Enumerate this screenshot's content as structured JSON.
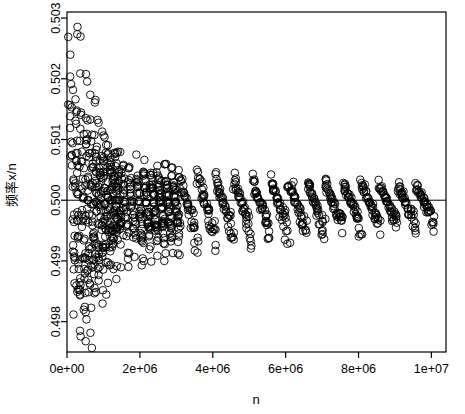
{
  "chart_data": {
    "type": "scatter",
    "title": "",
    "xlabel": "n",
    "ylabel": "频率x/n",
    "xlim": [
      0,
      10400000
    ],
    "ylim": [
      0.4975,
      0.5031
    ],
    "grid": false,
    "legend": null,
    "xticks": [
      "0e+00",
      "2e+06",
      "4e+06",
      "6e+06",
      "8e+06",
      "1e+07"
    ],
    "xtick_values": [
      0,
      2000000,
      4000000,
      6000000,
      8000000,
      10000000
    ],
    "yticks": [
      "0.498",
      "0.499",
      "0.500",
      "0.501",
      "0.502",
      "0.503"
    ],
    "ytick_values": [
      0.498,
      0.499,
      0.5,
      0.501,
      0.502,
      0.503
    ],
    "reference_line": {
      "y": 0.5,
      "orientation": "horizontal",
      "color": "#000000"
    },
    "marker": {
      "shape": "circle-open",
      "color": "#000000",
      "size": 5
    },
    "points_note": "约1000个随机模拟点，频率随n增大收敛于0.5",
    "points": [
      [
        60000,
        0.50275
      ],
      [
        95000,
        0.50175
      ],
      [
        120000,
        0.50165
      ],
      [
        140000,
        0.5013
      ],
      [
        150000,
        0.50085
      ],
      [
        160000,
        0.5006
      ],
      [
        170000,
        0.50025
      ],
      [
        180000,
        0.49965
      ],
      [
        190000,
        0.49935
      ],
      [
        200000,
        0.49885
      ],
      [
        210000,
        0.49835
      ],
      [
        220000,
        0.4979
      ],
      [
        230000,
        0.49765
      ],
      [
        240000,
        0.50215
      ],
      [
        250000,
        0.50155
      ],
      [
        260000,
        0.50115
      ],
      [
        270000,
        0.50075
      ],
      [
        280000,
        0.5004
      ],
      [
        290000,
        0.5001
      ],
      [
        300000,
        0.49975
      ],
      [
        310000,
        0.49945
      ],
      [
        320000,
        0.49915
      ],
      [
        330000,
        0.4988
      ],
      [
        340000,
        0.49845
      ],
      [
        350000,
        0.49805
      ],
      [
        360000,
        0.49755
      ],
      [
        370000,
        0.49725
      ],
      [
        380000,
        0.50195
      ],
      [
        390000,
        0.50145
      ],
      [
        400000,
        0.50105
      ],
      [
        410000,
        0.50065
      ],
      [
        420000,
        0.5003
      ],
      [
        430000,
        0.50005
      ],
      [
        440000,
        0.4998
      ],
      [
        450000,
        0.49955
      ],
      [
        460000,
        0.49925
      ],
      [
        470000,
        0.49895
      ],
      [
        480000,
        0.49865
      ],
      [
        490000,
        0.4983
      ],
      [
        500000,
        0.49795
      ],
      [
        510000,
        0.4976
      ],
      [
        520000,
        0.50165
      ],
      [
        530000,
        0.50125
      ],
      [
        540000,
        0.50085
      ],
      [
        550000,
        0.50055
      ],
      [
        560000,
        0.50025
      ],
      [
        570000,
        0.5
      ],
      [
        580000,
        0.49975
      ],
      [
        590000,
        0.49945
      ],
      [
        600000,
        0.49915
      ],
      [
        610000,
        0.4989
      ],
      [
        620000,
        0.4986
      ],
      [
        630000,
        0.49825
      ],
      [
        640000,
        0.49785
      ],
      [
        650000,
        0.50135
      ],
      [
        660000,
        0.50105
      ],
      [
        670000,
        0.50075
      ],
      [
        680000,
        0.50045
      ],
      [
        690000,
        0.5002
      ],
      [
        700000,
        0.49995
      ],
      [
        710000,
        0.4997
      ],
      [
        720000,
        0.49945
      ],
      [
        730000,
        0.4992
      ],
      [
        740000,
        0.49895
      ],
      [
        750000,
        0.49865
      ],
      [
        760000,
        0.4983
      ],
      [
        770000,
        0.50115
      ],
      [
        780000,
        0.50085
      ],
      [
        790000,
        0.5006
      ],
      [
        800000,
        0.50035
      ],
      [
        810000,
        0.50015
      ],
      [
        820000,
        0.49995
      ],
      [
        830000,
        0.4997
      ],
      [
        840000,
        0.49945
      ],
      [
        850000,
        0.4992
      ],
      [
        860000,
        0.49895
      ],
      [
        870000,
        0.49865
      ],
      [
        880000,
        0.50105
      ],
      [
        890000,
        0.50075
      ],
      [
        900000,
        0.5005
      ],
      [
        910000,
        0.5003
      ],
      [
        920000,
        0.5001
      ],
      [
        930000,
        0.4999
      ],
      [
        940000,
        0.4997
      ],
      [
        950000,
        0.49945
      ],
      [
        960000,
        0.4992
      ],
      [
        970000,
        0.49895
      ],
      [
        980000,
        0.4987
      ],
      [
        990000,
        0.50095
      ],
      [
        1000000,
        0.50075
      ],
      [
        1010000,
        0.50055
      ],
      [
        1020000,
        0.50035
      ],
      [
        1030000,
        0.50015
      ],
      [
        1040000,
        0.49995
      ],
      [
        1050000,
        0.49975
      ],
      [
        1060000,
        0.49955
      ],
      [
        1070000,
        0.49935
      ],
      [
        1080000,
        0.4991
      ],
      [
        1090000,
        0.49885
      ],
      [
        1100000,
        0.50085
      ],
      [
        1110000,
        0.50065
      ],
      [
        1120000,
        0.50045
      ],
      [
        1130000,
        0.50025
      ],
      [
        1140000,
        0.50005
      ],
      [
        1150000,
        0.49985
      ],
      [
        1160000,
        0.49965
      ],
      [
        1170000,
        0.49945
      ],
      [
        1180000,
        0.49925
      ],
      [
        1190000,
        0.49905
      ],
      [
        1200000,
        0.50075
      ],
      [
        1210000,
        0.50055
      ],
      [
        1220000,
        0.50035
      ],
      [
        1230000,
        0.50018
      ],
      [
        1240000,
        0.5
      ],
      [
        1250000,
        0.49982
      ],
      [
        1260000,
        0.49965
      ],
      [
        1270000,
        0.49945
      ],
      [
        1280000,
        0.49925
      ],
      [
        1290000,
        0.49905
      ],
      [
        1300000,
        0.50068
      ],
      [
        1310000,
        0.5005
      ],
      [
        1320000,
        0.50033
      ],
      [
        1330000,
        0.50016
      ],
      [
        1340000,
        0.5
      ],
      [
        1350000,
        0.49984
      ],
      [
        1360000,
        0.49967
      ],
      [
        1370000,
        0.4995
      ],
      [
        1380000,
        0.4993
      ],
      [
        1390000,
        0.4991
      ],
      [
        1400000,
        0.50062
      ],
      [
        1410000,
        0.50046
      ],
      [
        1420000,
        0.5003
      ],
      [
        1430000,
        0.50015
      ],
      [
        1440000,
        0.5
      ],
      [
        1450000,
        0.49985
      ],
      [
        1460000,
        0.4997
      ],
      [
        1470000,
        0.49952
      ],
      [
        1480000,
        0.49934
      ],
      [
        1490000,
        0.49915
      ],
      [
        1500000,
        0.50058
      ],
      [
        1520000,
        0.50042
      ],
      [
        1540000,
        0.50027
      ],
      [
        1560000,
        0.50012
      ],
      [
        1580000,
        0.49998
      ],
      [
        1600000,
        0.49984
      ],
      [
        1620000,
        0.49969
      ],
      [
        1640000,
        0.49953
      ],
      [
        1660000,
        0.49936
      ],
      [
        1680000,
        0.49918
      ],
      [
        1700000,
        0.50055
      ],
      [
        1720000,
        0.5004
      ],
      [
        1740000,
        0.50025
      ],
      [
        1760000,
        0.50011
      ],
      [
        1780000,
        0.49997
      ],
      [
        1800000,
        0.49984
      ],
      [
        1820000,
        0.4997
      ],
      [
        1840000,
        0.49955
      ],
      [
        1860000,
        0.49938
      ],
      [
        1880000,
        0.4992
      ],
      [
        1900000,
        0.50052
      ],
      [
        1920000,
        0.50037
      ],
      [
        1940000,
        0.50023
      ],
      [
        1960000,
        0.5001
      ],
      [
        1980000,
        0.49997
      ],
      [
        2000000,
        0.49984
      ],
      [
        2020000,
        0.4997
      ],
      [
        2040000,
        0.49956
      ],
      [
        2060000,
        0.4994
      ],
      [
        2080000,
        0.49922
      ],
      [
        2100000,
        0.50048
      ],
      [
        2120000,
        0.50035
      ],
      [
        2140000,
        0.50022
      ],
      [
        2160000,
        0.50009
      ],
      [
        2180000,
        0.49996
      ],
      [
        2200000,
        0.49984
      ],
      [
        2220000,
        0.49971
      ],
      [
        2240000,
        0.49957
      ],
      [
        2260000,
        0.49942
      ],
      [
        2280000,
        0.49926
      ],
      [
        2300000,
        0.50046
      ],
      [
        2320000,
        0.50033
      ],
      [
        2340000,
        0.50021
      ],
      [
        2360000,
        0.50008
      ],
      [
        2380000,
        0.49996
      ],
      [
        2400000,
        0.49984
      ],
      [
        2420000,
        0.49972
      ],
      [
        2440000,
        0.49958
      ],
      [
        2460000,
        0.49944
      ],
      [
        2480000,
        0.49928
      ],
      [
        2500000,
        0.50044
      ],
      [
        2520000,
        0.50032
      ],
      [
        2540000,
        0.5002
      ],
      [
        2560000,
        0.50008
      ],
      [
        2580000,
        0.49996
      ],
      [
        2600000,
        0.49984
      ],
      [
        2620000,
        0.49972
      ],
      [
        2640000,
        0.4996
      ],
      [
        2660000,
        0.49946
      ],
      [
        2680000,
        0.49931
      ],
      [
        2700000,
        0.50042
      ],
      [
        2720000,
        0.5003
      ],
      [
        2740000,
        0.50019
      ],
      [
        2760000,
        0.50007
      ],
      [
        2780000,
        0.49996
      ],
      [
        2800000,
        0.49985
      ],
      [
        2820000,
        0.49973
      ],
      [
        2840000,
        0.49961
      ],
      [
        2860000,
        0.49948
      ],
      [
        2880000,
        0.49934
      ],
      [
        2900000,
        0.5004
      ],
      [
        2920000,
        0.50029
      ],
      [
        2940000,
        0.50018
      ],
      [
        2960000,
        0.50007
      ],
      [
        2980000,
        0.49996
      ],
      [
        3000000,
        0.49985
      ],
      [
        3020000,
        0.49974
      ],
      [
        3040000,
        0.49962
      ],
      [
        3060000,
        0.4995
      ],
      [
        3080000,
        0.49936
      ],
      [
        3100000,
        0.50038
      ],
      [
        3150000,
        0.50027
      ],
      [
        3200000,
        0.50016
      ],
      [
        3250000,
        0.50006
      ],
      [
        3300000,
        0.49995
      ],
      [
        3350000,
        0.49985
      ],
      [
        3400000,
        0.49974
      ],
      [
        3450000,
        0.49963
      ],
      [
        3500000,
        0.4995
      ],
      [
        3550000,
        0.49938
      ],
      [
        3600000,
        0.50036
      ],
      [
        3650000,
        0.50026
      ],
      [
        3700000,
        0.50015
      ],
      [
        3750000,
        0.50005
      ],
      [
        3800000,
        0.49995
      ],
      [
        3850000,
        0.49985
      ],
      [
        3900000,
        0.49975
      ],
      [
        3950000,
        0.49964
      ],
      [
        4000000,
        0.49952
      ],
      [
        4050000,
        0.4994
      ],
      [
        4100000,
        0.50034
      ],
      [
        4150000,
        0.50024
      ],
      [
        4200000,
        0.50014
      ],
      [
        4250000,
        0.50005
      ],
      [
        4300000,
        0.49995
      ],
      [
        4350000,
        0.49986
      ],
      [
        4400000,
        0.49976
      ],
      [
        4450000,
        0.49966
      ],
      [
        4500000,
        0.49954
      ],
      [
        4550000,
        0.49942
      ],
      [
        4600000,
        0.50032
      ],
      [
        4650000,
        0.50023
      ],
      [
        4700000,
        0.50014
      ],
      [
        4750000,
        0.50005
      ],
      [
        4800000,
        0.49996
      ],
      [
        4850000,
        0.49986
      ],
      [
        4900000,
        0.49977
      ],
      [
        4950000,
        0.49967
      ],
      [
        5000000,
        0.49956
      ],
      [
        5050000,
        0.49944
      ],
      [
        5100000,
        0.50031
      ],
      [
        5150000,
        0.50022
      ],
      [
        5200000,
        0.50013
      ],
      [
        5250000,
        0.50004
      ],
      [
        5300000,
        0.49996
      ],
      [
        5350000,
        0.49987
      ],
      [
        5400000,
        0.49978
      ],
      [
        5450000,
        0.49968
      ],
      [
        5500000,
        0.49958
      ],
      [
        5550000,
        0.49946
      ],
      [
        5600000,
        0.5003
      ],
      [
        5650000,
        0.50021
      ],
      [
        5700000,
        0.50013
      ],
      [
        5750000,
        0.50004
      ],
      [
        5800000,
        0.49996
      ],
      [
        5850000,
        0.49988
      ],
      [
        5900000,
        0.49979
      ],
      [
        5950000,
        0.4997
      ],
      [
        6000000,
        0.4996
      ],
      [
        6050000,
        0.49948
      ],
      [
        6100000,
        0.50029
      ],
      [
        6150000,
        0.50021
      ],
      [
        6200000,
        0.50012
      ],
      [
        6250000,
        0.50004
      ],
      [
        6300000,
        0.49996
      ],
      [
        6350000,
        0.49988
      ],
      [
        6400000,
        0.4998
      ],
      [
        6450000,
        0.49971
      ],
      [
        6500000,
        0.49961
      ],
      [
        6550000,
        0.4995
      ],
      [
        6600000,
        0.50028
      ],
      [
        6650000,
        0.5002
      ],
      [
        6700000,
        0.50012
      ],
      [
        6750000,
        0.50004
      ],
      [
        6800000,
        0.49996
      ],
      [
        6850000,
        0.49988
      ],
      [
        6900000,
        0.4998
      ],
      [
        6950000,
        0.49972
      ],
      [
        7000000,
        0.49963
      ],
      [
        7050000,
        0.49952
      ],
      [
        7100000,
        0.50027
      ],
      [
        7150000,
        0.50019
      ],
      [
        7200000,
        0.50012
      ],
      [
        7250000,
        0.50004
      ],
      [
        7300000,
        0.49996
      ],
      [
        7350000,
        0.49989
      ],
      [
        7400000,
        0.49981
      ],
      [
        7450000,
        0.49973
      ],
      [
        7500000,
        0.49964
      ],
      [
        7550000,
        0.49954
      ],
      [
        7600000,
        0.50026
      ],
      [
        7650000,
        0.50019
      ],
      [
        7700000,
        0.50011
      ],
      [
        7750000,
        0.50004
      ],
      [
        7800000,
        0.49997
      ],
      [
        7850000,
        0.49989
      ],
      [
        7900000,
        0.49982
      ],
      [
        7950000,
        0.49974
      ],
      [
        8000000,
        0.49965
      ],
      [
        8050000,
        0.49955
      ],
      [
        8100000,
        0.50026
      ],
      [
        8150000,
        0.50018
      ],
      [
        8200000,
        0.50011
      ],
      [
        8250000,
        0.50004
      ],
      [
        8300000,
        0.49997
      ],
      [
        8350000,
        0.4999
      ],
      [
        8400000,
        0.49982
      ],
      [
        8450000,
        0.49975
      ],
      [
        8500000,
        0.49966
      ],
      [
        8550000,
        0.49956
      ],
      [
        8600000,
        0.50025
      ],
      [
        8650000,
        0.50018
      ],
      [
        8700000,
        0.50011
      ],
      [
        8750000,
        0.50004
      ],
      [
        8800000,
        0.49997
      ],
      [
        8850000,
        0.4999
      ],
      [
        8900000,
        0.49983
      ],
      [
        8950000,
        0.49975
      ],
      [
        9000000,
        0.49967
      ],
      [
        9050000,
        0.49957
      ],
      [
        9100000,
        0.50024
      ],
      [
        9150000,
        0.50017
      ],
      [
        9200000,
        0.50011
      ],
      [
        9250000,
        0.50004
      ],
      [
        9300000,
        0.49997
      ],
      [
        9350000,
        0.4999
      ],
      [
        9400000,
        0.49983
      ],
      [
        9450000,
        0.49976
      ],
      [
        9500000,
        0.49968
      ],
      [
        9550000,
        0.49958
      ],
      [
        9600000,
        0.50024
      ],
      [
        9650000,
        0.50017
      ],
      [
        9700000,
        0.5001
      ],
      [
        9750000,
        0.50004
      ],
      [
        9800000,
        0.49997
      ],
      [
        9850000,
        0.49991
      ],
      [
        9900000,
        0.49984
      ],
      [
        9950000,
        0.49977
      ],
      [
        10000000,
        0.49969
      ],
      [
        10050000,
        0.49959
      ]
    ]
  }
}
